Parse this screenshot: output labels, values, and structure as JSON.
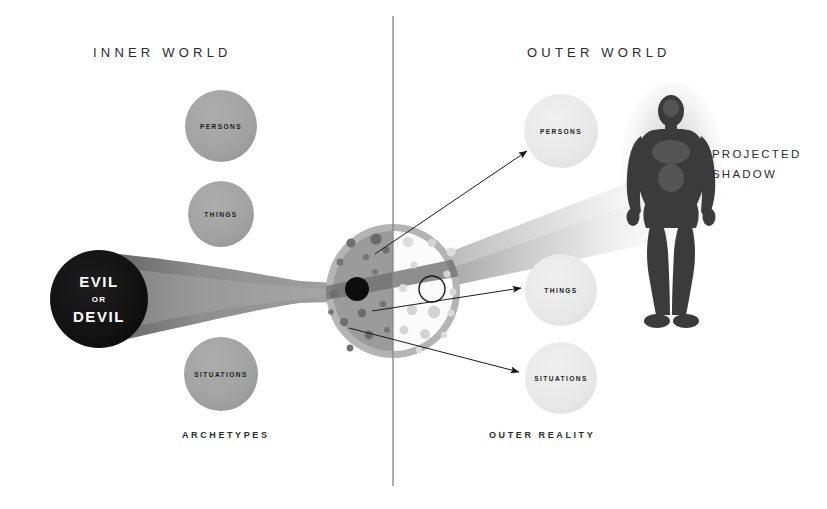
{
  "diagram": {
    "title_inner": "INNER WORLD",
    "title_outer": "OUTER WORLD",
    "label_archetypes": "ARCHETYPES",
    "label_outer_reality": "OUTER REALITY",
    "projected_shadow_line1": "PROJECTED",
    "projected_shadow_line2": "SHADOW"
  },
  "core": {
    "line1": "EVIL",
    "line2": "OR",
    "line3": "DEVIL",
    "fill": "#111111"
  },
  "inner_bubbles": [
    {
      "label": "PERSONS",
      "cx": 221,
      "cy": 126,
      "r": 36,
      "fill": "#a3a3a3"
    },
    {
      "label": "THINGS",
      "cx": 221,
      "cy": 214,
      "r": 33,
      "fill": "#a3a3a3"
    },
    {
      "label": "SITUATIONS",
      "cx": 221,
      "cy": 374,
      "r": 37,
      "fill": "#a3a3a3"
    }
  ],
  "outer_bubbles": [
    {
      "label": "PERSONS",
      "cx": 561,
      "cy": 131,
      "r": 37,
      "fill": "#e9e9e9"
    },
    {
      "label": "THINGS",
      "cx": 561,
      "cy": 290,
      "r": 36,
      "fill": "#e9e9e9"
    },
    {
      "label": "SITUATIONS",
      "cx": 561,
      "cy": 378,
      "r": 36,
      "fill": "#e9e9e9"
    }
  ],
  "ego_disc": {
    "cx": 393,
    "cy": 291,
    "r": 67,
    "left_fill": "#9b9b9b",
    "right_fill": "#fbfbfb",
    "rim_fill": "#b0b0b0",
    "dark_dot_fill": "#6e6e6e",
    "light_dot_fill": "#dedede",
    "complex_dot": {
      "cx": 357,
      "cy": 289,
      "r": 12,
      "fill": "#0d0d0d"
    },
    "open_ring": {
      "cx": 432,
      "cy": 289,
      "r": 13,
      "stroke": "#1a1a1a"
    }
  },
  "beams": {
    "inner_beam_color_start": "#6f6f6f",
    "inner_beam_color_end": "#9a9a9a",
    "outer_beam_color_start": "#9a9a9a",
    "outer_beam_color_end": "#ffffff"
  },
  "shadow_figure": {
    "name": "projected-shadow-figure",
    "fill": "#3a3a3a",
    "halo": "#cfcfcf"
  },
  "divider": {
    "x": 393,
    "y1": 16,
    "y2": 486,
    "color": "#8a8a8a"
  },
  "projection_arrows": [
    {
      "from_x": 375,
      "from_y": 254,
      "to_x": 527,
      "to_y": 151
    },
    {
      "from_x": 372,
      "from_y": 311,
      "to_x": 521,
      "to_y": 288
    },
    {
      "from_x": 349,
      "from_y": 328,
      "to_x": 519,
      "to_y": 372
    }
  ]
}
